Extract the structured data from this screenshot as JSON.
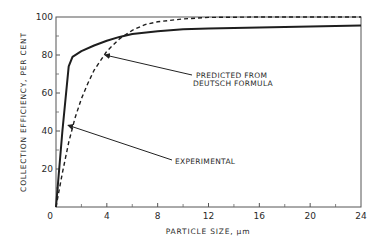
{
  "chart_data": {
    "type": "line",
    "title": "",
    "xlabel": "PARTICLE SIZE, μm",
    "ylabel": "COLLECTION EFFICIENCY, PER CENT",
    "xlim": [
      0,
      24
    ],
    "ylim": [
      0,
      100
    ],
    "xticks": [
      0,
      4,
      8,
      12,
      16,
      20,
      24
    ],
    "xticks_minor": [
      2,
      6,
      10,
      14,
      18,
      22
    ],
    "yticks": [
      20,
      40,
      60,
      80,
      100
    ],
    "yticks_minor": [
      10,
      30,
      50,
      70,
      90
    ],
    "grid": false,
    "series": [
      {
        "name": "EXPERIMENTAL",
        "style": "solid",
        "x": [
          0,
          0.5,
          1.0,
          1.3,
          2,
          3,
          4,
          5,
          6,
          8,
          10,
          12,
          16,
          20,
          24
        ],
        "y": [
          0,
          40,
          74,
          79,
          82,
          85,
          87.5,
          89.5,
          91,
          92.5,
          93.5,
          94,
          94.5,
          95,
          95.5
        ]
      },
      {
        "name": "PREDICTED FROM DEUTSCH FORMULA",
        "style": "dashed",
        "x": [
          0,
          0.5,
          1,
          1.5,
          2,
          2.5,
          3,
          3.5,
          4,
          5,
          6,
          7,
          8,
          10,
          12,
          16,
          20,
          24
        ],
        "y": [
          0,
          18,
          34,
          47,
          57,
          65,
          72,
          77,
          82,
          88.5,
          93,
          96,
          97.5,
          99,
          99.8,
          100,
          100,
          100
        ]
      }
    ],
    "annotations": [
      {
        "text": [
          "PREDICTED FROM",
          "DEUTSCH FORMULA"
        ],
        "points_to": "PREDICTED FROM DEUTSCH FORMULA",
        "arrow_tip": [
          3.7,
          80
        ]
      },
      {
        "text": [
          "EXPERIMENTAL"
        ],
        "points_to": "EXPERIMENTAL",
        "arrow_tip": [
          0.8,
          43
        ]
      }
    ],
    "legend": null
  },
  "labels": {
    "x_ticks": [
      "0",
      "4",
      "8",
      "12",
      "16",
      "20",
      "24"
    ],
    "y_ticks": [
      "20",
      "40",
      "60",
      "80",
      "100"
    ],
    "xlabel": "PARTICLE SIZE, μm",
    "ylabel": "COLLECTION EFFICIENCY, PER CENT",
    "annot_predicted_1": "PREDICTED FROM",
    "annot_predicted_2": "DEUTSCH FORMULA",
    "annot_experimental": "EXPERIMENTAL"
  }
}
